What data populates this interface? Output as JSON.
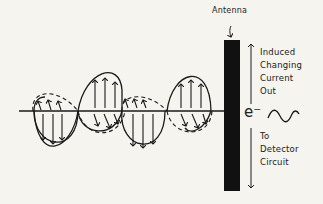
{
  "diagram": {
    "antenna_label": "Antenna",
    "electron_label": "e⁻",
    "induced_label_lines": [
      "Induced",
      "Changing",
      "Current",
      "Out"
    ],
    "detector_label_lines": [
      "To",
      "Detector",
      "Circuit"
    ],
    "colors": {
      "ink": "#1a1a1a",
      "antenna": "#111111",
      "paper": "#f5f4ef"
    }
  }
}
